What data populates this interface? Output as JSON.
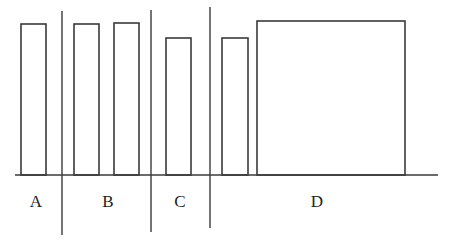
{
  "diagram": {
    "colors": {
      "stroke": "#3a3a3a",
      "background": "#ffffff",
      "text": "#222222"
    },
    "baseline": {
      "x1": 15,
      "x2": 438,
      "y": 175
    },
    "dividers": [
      {
        "x": 62,
        "y1": 11,
        "y2": 235
      },
      {
        "x": 151,
        "y1": 10,
        "y2": 232
      },
      {
        "x": 210,
        "y1": 7,
        "y2": 228
      }
    ],
    "groups": [
      {
        "label": "A",
        "label_x": 36,
        "label_y": 203,
        "bars": [
          {
            "x": 21,
            "width": 25,
            "top": 24
          }
        ]
      },
      {
        "label": "B",
        "label_x": 108,
        "label_y": 203,
        "bars": [
          {
            "x": 74,
            "width": 25,
            "top": 24
          },
          {
            "x": 114,
            "width": 25,
            "top": 23
          }
        ]
      },
      {
        "label": "C",
        "label_x": 180,
        "label_y": 203,
        "bars": [
          {
            "x": 166,
            "width": 25,
            "top": 38
          }
        ]
      },
      {
        "label": "D",
        "label_x": 317,
        "label_y": 203,
        "bars": [
          {
            "x": 222,
            "width": 26,
            "top": 38
          },
          {
            "x": 257,
            "width": 148,
            "top": 21
          }
        ]
      }
    ]
  }
}
